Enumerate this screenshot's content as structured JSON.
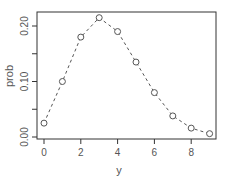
{
  "chart_data": {
    "type": "line",
    "title": "",
    "xlabel": "y",
    "ylabel": "prob",
    "x": [
      0,
      1,
      2,
      3,
      4,
      5,
      6,
      7,
      8,
      9
    ],
    "series": [
      {
        "name": "prob",
        "values": [
          0.025,
          0.1,
          0.18,
          0.215,
          0.19,
          0.135,
          0.08,
          0.038,
          0.016,
          0.006
        ],
        "style": "dashed line with open circles"
      }
    ],
    "xticks": [
      "0",
      "2",
      "4",
      "6",
      "8"
    ],
    "yticks": [
      "0.00",
      "0.10",
      "0.20"
    ],
    "ytick_minor_positions": [
      0.0,
      0.05,
      0.1,
      0.15,
      0.2
    ],
    "xlim": [
      -0.3,
      9.3
    ],
    "ylim": [
      0.0,
      0.225
    ],
    "grid": false,
    "legend": null,
    "colors": {
      "line": "#555555",
      "axis": "#333333",
      "text": "#555555"
    }
  }
}
